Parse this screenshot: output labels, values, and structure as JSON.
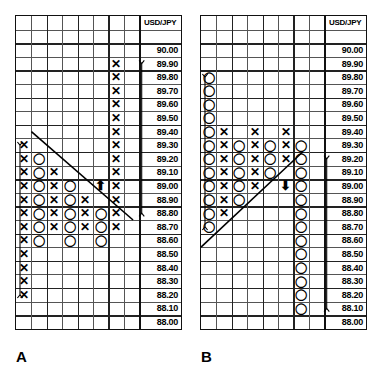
{
  "chart_data": [
    {
      "id": "A",
      "type": "table",
      "title": "USD/JPY",
      "subtitle": "Point and figure chart A",
      "caption": "A",
      "header": "USD/JPY",
      "xlabel": "",
      "ylabel": "USD/JPY",
      "grid": true,
      "columns": 8,
      "rows": 23,
      "ylim": [
        88.0,
        90.2
      ],
      "tick_step": 0.1,
      "price_labels": [
        "",
        "",
        "90.00",
        "89.90",
        "89.80",
        "89.70",
        "89.60",
        "89.50",
        "89.40",
        "89.30",
        "89.20",
        "89.10",
        "89.00",
        "88.90",
        "88.80",
        "88.70",
        "88.60",
        "88.50",
        "88.40",
        "88.30",
        "88.20",
        "88.10",
        "88.00"
      ],
      "marks": [
        {
          "col": 6,
          "price": "89.90",
          "symbol": "X"
        },
        {
          "col": 6,
          "price": "89.80",
          "symbol": "X"
        },
        {
          "col": 6,
          "price": "89.70",
          "symbol": "X"
        },
        {
          "col": 6,
          "price": "89.60",
          "symbol": "X"
        },
        {
          "col": 6,
          "price": "89.50",
          "symbol": "X"
        },
        {
          "col": 6,
          "price": "89.40",
          "symbol": "X"
        },
        {
          "col": 6,
          "price": "89.30",
          "symbol": "X"
        },
        {
          "col": 6,
          "price": "89.20",
          "symbol": "X"
        },
        {
          "col": 6,
          "price": "89.10",
          "symbol": "X"
        },
        {
          "col": 6,
          "price": "89.00",
          "symbol": "X"
        },
        {
          "col": 6,
          "price": "88.90",
          "symbol": "X"
        },
        {
          "col": 6,
          "price": "88.80",
          "symbol": "X"
        },
        {
          "col": 6,
          "price": "88.70",
          "symbol": "X"
        },
        {
          "col": 0,
          "price": "89.30",
          "symbol": "X"
        },
        {
          "col": 0,
          "price": "89.20",
          "symbol": "X"
        },
        {
          "col": 0,
          "price": "89.10",
          "symbol": "X"
        },
        {
          "col": 0,
          "price": "89.00",
          "symbol": "X"
        },
        {
          "col": 0,
          "price": "88.90",
          "symbol": "X"
        },
        {
          "col": 0,
          "price": "88.80",
          "symbol": "X"
        },
        {
          "col": 0,
          "price": "88.70",
          "symbol": "X"
        },
        {
          "col": 0,
          "price": "88.60",
          "symbol": "X"
        },
        {
          "col": 0,
          "price": "88.50",
          "symbol": "X"
        },
        {
          "col": 0,
          "price": "88.40",
          "symbol": "X"
        },
        {
          "col": 0,
          "price": "88.30",
          "symbol": "X"
        },
        {
          "col": 0,
          "price": "88.20",
          "symbol": "X"
        },
        {
          "col": 1,
          "price": "89.20",
          "symbol": "O"
        },
        {
          "col": 1,
          "price": "89.10",
          "symbol": "O"
        },
        {
          "col": 1,
          "price": "89.00",
          "symbol": "O"
        },
        {
          "col": 1,
          "price": "88.90",
          "symbol": "O"
        },
        {
          "col": 1,
          "price": "88.80",
          "symbol": "O"
        },
        {
          "col": 1,
          "price": "88.70",
          "symbol": "O"
        },
        {
          "col": 1,
          "price": "88.60",
          "symbol": "O"
        },
        {
          "col": 2,
          "price": "89.10",
          "symbol": "X"
        },
        {
          "col": 2,
          "price": "89.00",
          "symbol": "X"
        },
        {
          "col": 2,
          "price": "88.90",
          "symbol": "X"
        },
        {
          "col": 2,
          "price": "88.80",
          "symbol": "X"
        },
        {
          "col": 2,
          "price": "88.70",
          "symbol": "X"
        },
        {
          "col": 3,
          "price": "89.00",
          "symbol": "O"
        },
        {
          "col": 3,
          "price": "88.90",
          "symbol": "O"
        },
        {
          "col": 3,
          "price": "88.80",
          "symbol": "O"
        },
        {
          "col": 3,
          "price": "88.70",
          "symbol": "O"
        },
        {
          "col": 3,
          "price": "88.60",
          "symbol": "O"
        },
        {
          "col": 4,
          "price": "88.90",
          "symbol": "X"
        },
        {
          "col": 4,
          "price": "88.80",
          "symbol": "X"
        },
        {
          "col": 4,
          "price": "88.70",
          "symbol": "X"
        },
        {
          "col": 5,
          "price": "88.80",
          "symbol": "O"
        },
        {
          "col": 5,
          "price": "88.70",
          "symbol": "O"
        },
        {
          "col": 5,
          "price": "88.60",
          "symbol": "O"
        }
      ],
      "trendline": {
        "from_col": 1,
        "from_price": "89.40",
        "to_col": 7,
        "to_price": "88.75",
        "direction": "down"
      },
      "annotations": [
        {
          "kind": "arrow-up",
          "col": 5,
          "price": "89.00",
          "label": "breakout arrow"
        },
        {
          "kind": "range-bracket",
          "side": "left",
          "from_price": "89.30",
          "to_price": "88.20",
          "label": "left price range"
        },
        {
          "kind": "range-bracket",
          "side": "right",
          "from_price": "89.90",
          "to_price": "88.80",
          "label": "right price range"
        }
      ]
    },
    {
      "id": "B",
      "type": "table",
      "title": "USD/JPY",
      "subtitle": "Point and figure chart B",
      "caption": "B",
      "header": "USD/JPY",
      "xlabel": "",
      "ylabel": "USD/JPY",
      "grid": true,
      "columns": 8,
      "rows": 23,
      "ylim": [
        88.0,
        90.2
      ],
      "tick_step": 0.1,
      "price_labels": [
        "",
        "",
        "90.00",
        "89.90",
        "89.80",
        "89.70",
        "89.60",
        "89.50",
        "89.40",
        "89.30",
        "89.20",
        "89.10",
        "89.00",
        "88.90",
        "88.80",
        "88.70",
        "88.60",
        "88.50",
        "88.40",
        "88.30",
        "88.20",
        "88.10",
        "88.00"
      ],
      "marks": [
        {
          "col": 0,
          "price": "89.80",
          "symbol": "O"
        },
        {
          "col": 0,
          "price": "89.70",
          "symbol": "O"
        },
        {
          "col": 0,
          "price": "89.60",
          "symbol": "O"
        },
        {
          "col": 0,
          "price": "89.50",
          "symbol": "O"
        },
        {
          "col": 0,
          "price": "89.40",
          "symbol": "O"
        },
        {
          "col": 0,
          "price": "89.30",
          "symbol": "O"
        },
        {
          "col": 0,
          "price": "89.20",
          "symbol": "O"
        },
        {
          "col": 0,
          "price": "89.10",
          "symbol": "O"
        },
        {
          "col": 0,
          "price": "89.00",
          "symbol": "O"
        },
        {
          "col": 0,
          "price": "88.90",
          "symbol": "O"
        },
        {
          "col": 0,
          "price": "88.80",
          "symbol": "O"
        },
        {
          "col": 0,
          "price": "88.70",
          "symbol": "O"
        },
        {
          "col": 1,
          "price": "89.40",
          "symbol": "X"
        },
        {
          "col": 1,
          "price": "89.30",
          "symbol": "X"
        },
        {
          "col": 1,
          "price": "89.20",
          "symbol": "X"
        },
        {
          "col": 1,
          "price": "89.10",
          "symbol": "X"
        },
        {
          "col": 1,
          "price": "89.00",
          "symbol": "X"
        },
        {
          "col": 1,
          "price": "88.90",
          "symbol": "X"
        },
        {
          "col": 1,
          "price": "88.80",
          "symbol": "X"
        },
        {
          "col": 2,
          "price": "89.30",
          "symbol": "O"
        },
        {
          "col": 2,
          "price": "89.20",
          "symbol": "O"
        },
        {
          "col": 2,
          "price": "89.10",
          "symbol": "O"
        },
        {
          "col": 2,
          "price": "89.00",
          "symbol": "O"
        },
        {
          "col": 2,
          "price": "88.90",
          "symbol": "O"
        },
        {
          "col": 3,
          "price": "89.40",
          "symbol": "X"
        },
        {
          "col": 3,
          "price": "89.30",
          "symbol": "X"
        },
        {
          "col": 3,
          "price": "89.20",
          "symbol": "X"
        },
        {
          "col": 3,
          "price": "89.10",
          "symbol": "X"
        },
        {
          "col": 3,
          "price": "89.00",
          "symbol": "X"
        },
        {
          "col": 4,
          "price": "89.30",
          "symbol": "O"
        },
        {
          "col": 4,
          "price": "89.20",
          "symbol": "O"
        },
        {
          "col": 4,
          "price": "89.10",
          "symbol": "O"
        },
        {
          "col": 5,
          "price": "89.40",
          "symbol": "X"
        },
        {
          "col": 5,
          "price": "89.30",
          "symbol": "X"
        },
        {
          "col": 5,
          "price": "89.20",
          "symbol": "X"
        },
        {
          "col": 6,
          "price": "89.30",
          "symbol": "O"
        },
        {
          "col": 6,
          "price": "89.20",
          "symbol": "O"
        },
        {
          "col": 6,
          "price": "89.10",
          "symbol": "O"
        },
        {
          "col": 6,
          "price": "89.00",
          "symbol": "O"
        },
        {
          "col": 6,
          "price": "88.90",
          "symbol": "O"
        },
        {
          "col": 6,
          "price": "88.80",
          "symbol": "O"
        },
        {
          "col": 6,
          "price": "88.70",
          "symbol": "O"
        },
        {
          "col": 6,
          "price": "88.60",
          "symbol": "O"
        },
        {
          "col": 6,
          "price": "88.50",
          "symbol": "O"
        },
        {
          "col": 6,
          "price": "88.40",
          "symbol": "O"
        },
        {
          "col": 6,
          "price": "88.30",
          "symbol": "O"
        },
        {
          "col": 6,
          "price": "88.20",
          "symbol": "O"
        },
        {
          "col": 6,
          "price": "88.10",
          "symbol": "O"
        }
      ],
      "trendline": {
        "from_col": 0,
        "from_price": "88.55",
        "to_col": 6,
        "to_price": "89.25",
        "direction": "up"
      },
      "annotations": [
        {
          "kind": "arrow-down",
          "col": 5,
          "price": "89.00",
          "label": "breakdown arrow"
        },
        {
          "kind": "range-bracket",
          "side": "left",
          "from_price": "89.80",
          "to_price": "88.70",
          "label": "left price range"
        },
        {
          "kind": "range-bracket",
          "side": "right",
          "from_price": "89.20",
          "to_price": "88.10",
          "label": "right price range"
        }
      ]
    }
  ],
  "figure": {
    "panel_a_caption": "A",
    "panel_b_caption": "B",
    "header_text": "USD/JPY"
  }
}
